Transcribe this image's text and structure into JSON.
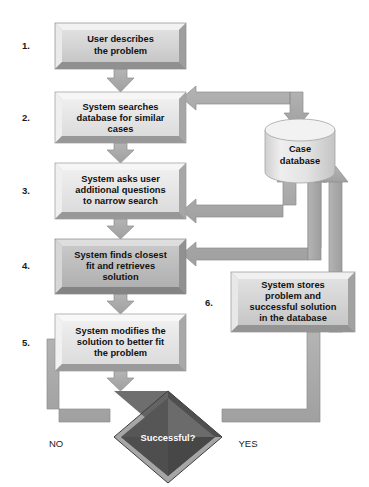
{
  "diagram": {
    "colors": {
      "background": "#ffffff",
      "box_light_fill": "#e8e8e8",
      "box_mid_fill": "#d2d2d2",
      "box_dark_fill": "#bdbdbd",
      "bevel_highlight": "#f4f4f4",
      "bevel_shadow": "#8f8f8f",
      "box_border": "#9a9a9a",
      "arrow_fill": "#a8a8a8",
      "arrow_shadow": "#8a8a8a",
      "diamond_fill": "#5e5e5e",
      "diamond_dark": "#3c3c3c",
      "diamond_light": "#7d7d7d",
      "cylinder_fill": "#dcdcdc",
      "cylinder_top": "#f0f0f0",
      "text_dark": "#111111",
      "text_light": "#ffffff"
    },
    "steps": [
      {
        "number": "1.",
        "text_lines": [
          "User describes",
          "the problem"
        ]
      },
      {
        "number": "2.",
        "text_lines": [
          "System searches",
          "database for similar",
          "cases"
        ]
      },
      {
        "number": "3.",
        "text_lines": [
          "System asks user",
          "additional questions",
          "to narrow search"
        ]
      },
      {
        "number": "4.",
        "text_lines": [
          "System finds closest",
          "fit and retrieves",
          "solution"
        ]
      },
      {
        "number": "5.",
        "text_lines": [
          "System modifies the",
          "solution to better fit",
          "the problem"
        ]
      },
      {
        "number": "6.",
        "text_lines": [
          "System stores",
          "problem and",
          "successful solution",
          "in the database"
        ]
      }
    ],
    "database": {
      "label_lines": [
        "Case",
        "database"
      ]
    },
    "decision": {
      "label": "Successful?"
    },
    "branches": {
      "no_label": "NO",
      "yes_label": "YES"
    }
  }
}
